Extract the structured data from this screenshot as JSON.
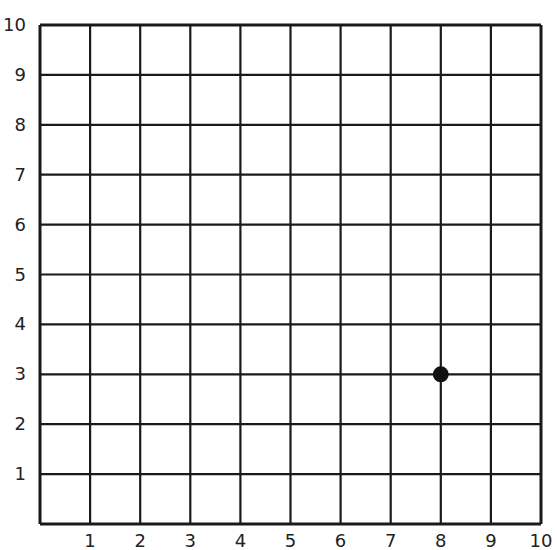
{
  "chart_data": {
    "type": "scatter",
    "title": "",
    "xlabel": "",
    "ylabel": "",
    "xlim": [
      0,
      10
    ],
    "ylim": [
      0,
      10
    ],
    "grid": true,
    "x_ticks": [
      "1",
      "2",
      "3",
      "4",
      "5",
      "6",
      "7",
      "8",
      "9",
      "10"
    ],
    "y_ticks": [
      "1",
      "2",
      "3",
      "4",
      "5",
      "6",
      "7",
      "8",
      "9",
      "10"
    ],
    "points": [
      {
        "x": 8,
        "y": 3
      }
    ],
    "colors": {
      "grid": "#1a1a1a",
      "point": "#111111"
    }
  }
}
